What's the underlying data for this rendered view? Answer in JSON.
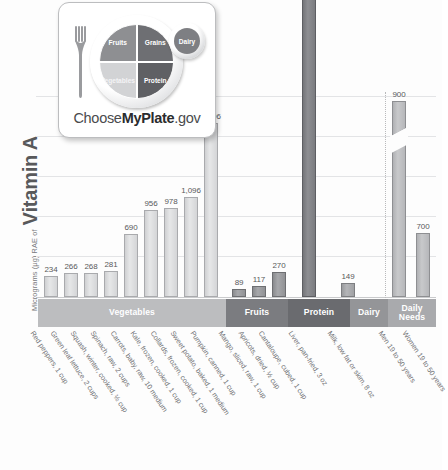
{
  "yaxis": {
    "prefix": "Micrograms (µg) RAE of",
    "nutrient": "Vitamin A"
  },
  "logo": {
    "name": "myplate-logo",
    "wordmark_pre": "Choose",
    "wordmark_bold": "MyPlate",
    "wordmark_post": ".gov",
    "segments": {
      "fruits": "Fruits",
      "grains": "Grains",
      "vegetables": "Vegetables",
      "protein": "Protein",
      "dairy": "Dairy"
    }
  },
  "bands": [
    {
      "label": "Vegetables",
      "color": "#bcbdbf"
    },
    {
      "label": "Fruits",
      "color": "#7b7c80"
    },
    {
      "label": "Protein",
      "color": "#6a6b6f"
    },
    {
      "label": "Dairy",
      "color": "#949598"
    },
    {
      "label": "Daily Needs",
      "color": "#a9aaad"
    }
  ],
  "chart_data": {
    "type": "bar",
    "title": "",
    "xlabel": "",
    "ylabel": "Micrograms (µg) RAE of Vitamin A",
    "ylim": [
      0,
      2200
    ],
    "grid": true,
    "legend": "none",
    "axis_break": {
      "bar_index": 14,
      "note": "Liver bar truncated; true value 6,582"
    },
    "gridline_values": [
      2200,
      1800,
      1400,
      1000,
      600,
      200
    ],
    "categories": [
      "Red peppers, 1 cup",
      "Green leaf lettuce, 2 cups",
      "Squash, winter, cooked, ½ cup",
      "Spinach, raw, 2 cups",
      "Carrots, baby, raw, 10 medium",
      "Kale, frozen, cooked, 1 cup",
      "Collards, frozen, cooked, 1 cup",
      "Sweet potato, baked, 1 medium",
      "Pumpkin, canned, 1 cup",
      "Mango, sliced, raw, 1 cup",
      "Apricots, dried, ½ cup",
      "Cantaloupe, cubed, 1 cup",
      "Liver, pan-fried, 3 oz",
      "Milk, low fat or skim, 8 oz",
      "Men 19 to 50 years",
      "Women 19 to 50 years"
    ],
    "values": [
      234,
      266,
      268,
      281,
      690,
      956,
      978,
      1096,
      1906,
      89,
      117,
      270,
      6582,
      149,
      900,
      700
    ],
    "value_labels": [
      "234",
      "266",
      "268",
      "281",
      "690",
      "956",
      "978",
      "1,096",
      "1,906",
      "89",
      "117",
      "270",
      "6,582",
      "149",
      "900",
      "700"
    ],
    "groups": [
      "Vegetables",
      "Vegetables",
      "Vegetables",
      "Vegetables",
      "Vegetables",
      "Vegetables",
      "Vegetables",
      "Vegetables",
      "Vegetables",
      "Fruits",
      "Fruits",
      "Fruits",
      "Protein",
      "Dairy",
      "Daily Needs",
      "Daily Needs"
    ]
  }
}
